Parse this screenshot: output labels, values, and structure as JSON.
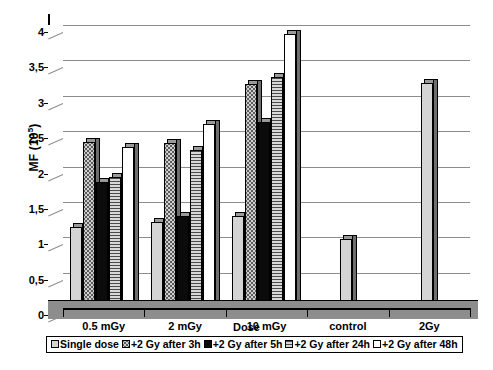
{
  "chart_data": {
    "type": "bar",
    "title": "",
    "xlabel": "Dose",
    "ylabel": "MF (10⁵)",
    "ylabel_base": "MF (10",
    "ylabel_exp": "5",
    "ylabel_close": ")",
    "categories": [
      "0.5 mGy",
      "2 mGy",
      "10 mGy",
      "control",
      "2Gy"
    ],
    "ylim": [
      0,
      4
    ],
    "ytick_labels": [
      "0",
      "0,5",
      "1",
      "1,5",
      "2",
      "2,5",
      "3",
      "3,5",
      "4"
    ],
    "ytick_values": [
      0,
      0.5,
      1,
      1.5,
      2,
      2.5,
      3,
      3.5,
      4
    ],
    "grid": true,
    "legend_position": "bottom",
    "series": [
      {
        "name": "Single dose",
        "pattern": "light",
        "values": [
          1.15,
          1.22,
          1.3,
          0.98,
          3.18
        ]
      },
      {
        "name": "+2 Gy after 3h",
        "pattern": "dots",
        "values": [
          2.35,
          2.33,
          3.17,
          null,
          null
        ]
      },
      {
        "name": "+2 Gy after 5h",
        "pattern": "black",
        "values": [
          1.78,
          1.3,
          2.63,
          null,
          null
        ]
      },
      {
        "name": "+2 Gy after 24h",
        "pattern": "hlines",
        "values": [
          1.85,
          2.23,
          3.27,
          null,
          null
        ]
      },
      {
        "name": "+2 Gy after 48h",
        "pattern": "white",
        "values": [
          2.27,
          2.6,
          3.88,
          null,
          null
        ]
      }
    ]
  },
  "colors": {
    "axis": "#000000",
    "grid": "#8d8d8d",
    "floor": "#8d8d8d",
    "bar_light": "#d4d4d4",
    "bar_dots": "#cfcfcf",
    "bar_black": "#0b0b0b",
    "bar_hlines": "#b9b9b9",
    "bar_white": "#ffffff",
    "bar_top": "#9a9a9a",
    "bar_side": "#6e6e6e"
  }
}
